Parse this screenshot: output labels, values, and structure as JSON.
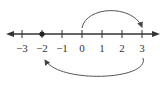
{
  "diagram": {
    "type": "number-line",
    "ticks": [
      {
        "value": -3,
        "label": "−3",
        "x": 22
      },
      {
        "value": -2,
        "label": "−2",
        "x": 42
      },
      {
        "value": -1,
        "label": "−1",
        "x": 62
      },
      {
        "value": 0,
        "label": "0",
        "x": 82
      },
      {
        "value": 1,
        "label": "1",
        "x": 102
      },
      {
        "value": 2,
        "label": "2",
        "x": 122
      },
      {
        "value": 3,
        "label": "3",
        "x": 142
      }
    ],
    "point": {
      "value": -2,
      "style": "filled-dot"
    },
    "arcs": [
      {
        "from": 0,
        "to": 3,
        "position": "above",
        "change": "+3"
      },
      {
        "from": 3,
        "to": -2,
        "position": "below",
        "change": "-5"
      }
    ],
    "colors": {
      "line": "#333333",
      "arc": "#555555"
    }
  }
}
